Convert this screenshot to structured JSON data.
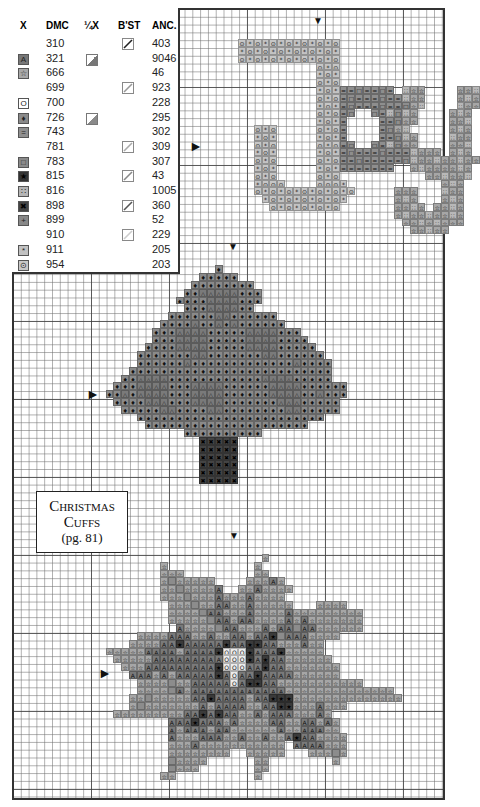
{
  "legend": {
    "headers": {
      "x": "X",
      "dmc": "DMC",
      "quarter_x": "¼X",
      "backstitch": "B'ST",
      "anchor": "ANC."
    },
    "rows": [
      {
        "dmc": "310",
        "anc": "403",
        "symbol": "",
        "sym_color": "",
        "quarter": false,
        "bst": "#222222"
      },
      {
        "dmc": "321",
        "anc": "9046",
        "symbol": "A",
        "sym_color": "#777777",
        "quarter": "#777777",
        "bst": ""
      },
      {
        "dmc": "666",
        "anc": "46",
        "symbol": "☆",
        "sym_color": "#a8a8a8",
        "quarter": false,
        "bst": ""
      },
      {
        "dmc": "699",
        "anc": "923",
        "symbol": "",
        "sym_color": "",
        "quarter": false,
        "bst": "#999999"
      },
      {
        "dmc": "700",
        "anc": "228",
        "symbol": "O",
        "sym_color": "#ffffff",
        "quarter": false,
        "bst": ""
      },
      {
        "dmc": "726",
        "anc": "295",
        "symbol": "♦",
        "sym_color": "#8a8a8a",
        "quarter": "#8a8a8a",
        "bst": ""
      },
      {
        "dmc": "743",
        "anc": "302",
        "symbol": "=",
        "sym_color": "#8f8f8f",
        "quarter": false,
        "bst": ""
      },
      {
        "dmc": "781",
        "anc": "309",
        "symbol": "",
        "sym_color": "",
        "quarter": false,
        "bst": "#aaaaaa"
      },
      {
        "dmc": "783",
        "anc": "307",
        "symbol": "□",
        "sym_color": "#8a8a8a",
        "quarter": false,
        "bst": ""
      },
      {
        "dmc": "815",
        "anc": "43",
        "symbol": "★",
        "sym_color": "#333333",
        "quarter": false,
        "bst": "#888888"
      },
      {
        "dmc": "816",
        "anc": "1005",
        "symbol": "∷",
        "sym_color": "#b5b5b5",
        "quarter": false,
        "bst": ""
      },
      {
        "dmc": "898",
        "anc": "360",
        "symbol": "✖",
        "sym_color": "#444444",
        "quarter": false,
        "bst": "#555555"
      },
      {
        "dmc": "899",
        "anc": "52",
        "symbol": "+",
        "sym_color": "#888888",
        "quarter": false,
        "bst": ""
      },
      {
        "dmc": "910",
        "anc": "229",
        "symbol": "",
        "sym_color": "",
        "quarter": false,
        "bst": "#cccccc"
      },
      {
        "dmc": "911",
        "anc": "205",
        "symbol": "*",
        "sym_color": "#c2c2c2",
        "quarter": false,
        "bst": ""
      },
      {
        "dmc": "954",
        "anc": "203",
        "symbol": "⊙",
        "sym_color": "#c8c8c8",
        "quarter": false,
        "bst": ""
      }
    ]
  },
  "title_box": {
    "line1": "Christmas",
    "line2": "Cuffs",
    "line3": "(pg. 81)"
  },
  "center_arrows": [
    {
      "dir": "down",
      "x": 313,
      "y": 14
    },
    {
      "dir": "right",
      "x": 189,
      "y": 139
    },
    {
      "dir": "down",
      "x": 228,
      "y": 240
    },
    {
      "dir": "right",
      "x": 86,
      "y": 387
    },
    {
      "dir": "down",
      "x": 229,
      "y": 529
    },
    {
      "dir": "right",
      "x": 98,
      "y": 666
    }
  ],
  "motifs": {
    "joy": {
      "name": "JOY",
      "origin": [
        29,
        4
      ],
      "key": {
        "s": [
          "⊙",
          "#c6c6c6"
        ],
        "a": [
          "*",
          "#c2c2c2"
        ],
        "e": [
          "=",
          "#8e8e8e"
        ],
        "b": [
          "□",
          "#8e8e8e"
        ],
        "t": [
          "☆",
          "#a6a6a6"
        ],
        "d": [
          "∷",
          "#b8b8b8"
        ]
      },
      "rows": [
        "sasasasasasas",
        "asasasasasasa",
        "sasasasasasas",
        "          sas                              ",
        "          asa                              ",
        "          sas                              ",
        "          asaeebeebe dtt    ttd",
        "          sasebeeebeedtt    tdt",
        "          asaebeeebeebtd    dtt",
        "          saseb  bedbdt    tdt",
        "          asae    eebtt    ttd",
        "  sas     sase    ebtd     tdt",
        "  asa     asae    eebdt    dtt",
        "  sas     saseb  bedbtt    ttd",
        "  asa     asaebeeebeeedttt tdt",
        "  sas     saseebeeeeebdttdttdtt",
        "  asa     asaeeeeeee  tdttttdt",
        "  sas     sas           ttdttd",
        "  asss    sssa            tdt",
        "  sasasasasasas     ttt   dtt",
        "   asasasasasa      tdt   tdt",
        "    sasasasas       ttdt ttdt",
        "                    tdttdttdt",
        "                     ttdtdttt",
        "                      ttdtt"
      ]
    },
    "tree": {
      "name": "Tree",
      "origin": [
        12,
        33
      ],
      "key": {
        "g": [
          "♦",
          "#8a8a8a"
        ],
        "r": [
          "△",
          "#7a7a7a"
        ],
        "x": [
          "✖",
          "#444444"
        ]
      },
      "rows": [
        "              g",
        "            ggggg",
        "           gggggggg",
        "          ggrrrrrggg",
        "         ggggrrrrggg",
        "          gggrrrrgg",
        "        ggggggrrgggggg",
        "       ggggrggrgrgggggg",
        "      gggrrrrgggggrrrrggg",
        "      gggrrrrgggggrrrrgggg",
        "     ggggrrrrgggggrrrrggggg",
        "    gggggggrrgggggggrrgggggg",
        "    ggggggrgggggggggggggrgggg",
        "   gggggggggggggggggggggggggg",
        "  ggrrrrggggggggggggrrrrggggg",
        " gggrrrrgggrrrrggggggrrrrgggggg",
        "ggrgrrrrgggrrrrggggggrrrrggrggg",
        " ggggrrrgggrrrrgggggggrrrggggg",
        "  gggggrrggggrrggggggggrrggggg",
        "    gggggggggggggggggggggggg",
        "     ggggggggggggggggggggg",
        "          gggggggggg",
        "            xxxxx",
        "            xxxxx",
        "            xxxxx",
        "            xxxxx",
        "            xxxxx",
        "            xxxxx"
      ]
    },
    "poinsettia": {
      "name": "Poinsettia",
      "origin": [
        12,
        70
      ],
      "key": {
        "t": [
          "☆",
          "#a6a6a6"
        ],
        "r": [
          "A",
          "#7a7a7a"
        ],
        "o": [
          "O",
          "#ececec"
        ],
        "k": [
          "★",
          "#3a3a3a"
        ],
        "n": [
          "",
          "#8c8c8c"
        ]
      },
      "rows": [
        "                    t",
        "       t           t",
        "       ttt         tt",
        "       tnttttt    tttrt",
        "       ttnttttr  ttrtttt",
        "       tttntttrtttrtttt",
        "        tttnttrrttrttttt   tttt",
        "        ttttnrrtttrttttrttttttttt",
        "        tttttnrrtrrttttrtrttttttt",
        "         rttttnrrtttrtrrnrrtttttt",
        "    ttttrrrttrttrrtrrknrrrtttt",
        "   ttttrrkrrrrrkrrkkrrtttrtt",
        "tttttrrrrtrrrrkoookrrrkttttt",
        " tttttrrrrrrrrroookrkrrtttttt",
        "  tttrrrrrrrrrkooorrkrrttttttt",
        "   rrrtrtrrrrrkrorrkrrrrtttttt",
        "    ttttnttrrrrrorkkrrttttttttttt",
        "    ttttnrtrrrrrrrrrrrrtttttttttttttt",
        "   ttntttttrrkrrrrtrrkkktttttttttttttt",
        "   tntttttttrtrrrrttrrkktttrttt",
        " tttttttttrrkrkrrttrtrrrtttrt",
        "        rrrkrrrtrttttrrttrrtrt",
        "        rtrrrtrrttttttrttrrrtt",
        "        rtttrrrttrttrttrkrrtttt",
        "        tttrttttttttttt rrrrttt",
        "        tttttttt  ttttt   tttnt",
        "        ntttt      tt        t",
        "        nttt       tt",
        "       tt          t"
      ]
    }
  }
}
